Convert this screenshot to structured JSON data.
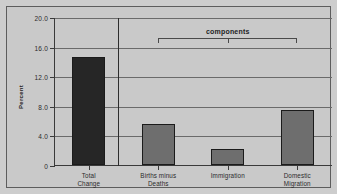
{
  "chart_data": {
    "type": "bar",
    "title": "",
    "xlabel": "",
    "ylabel": "Percent",
    "categories": [
      "Total Change",
      "Births minus Deaths",
      "Immigration",
      "Domestic Migration"
    ],
    "category_lines": [
      [
        "Total",
        "Change"
      ],
      [
        "Births minus",
        "Deaths"
      ],
      [
        "Immigration"
      ],
      [
        "Domestic",
        "Migration"
      ]
    ],
    "values": [
      14.6,
      5.6,
      2.1,
      7.4
    ],
    "bar_colors": [
      "#262626",
      "#6e6e6e",
      "#6e6e6e",
      "#6e6e6e"
    ],
    "ylim": [
      0,
      20
    ],
    "ytick_values": [
      0,
      4.0,
      8.0,
      12.0,
      16.0,
      20.0
    ],
    "ytick_labels": [
      "0",
      "4.0",
      "8.0",
      "12.0",
      "16.0",
      "20.0"
    ],
    "grid": true,
    "legend": "none",
    "annotations": [
      {
        "type": "bracket",
        "label": "components",
        "spans_categories": [
          "Births minus Deaths",
          "Immigration",
          "Domestic Migration"
        ]
      },
      {
        "type": "vertical-separator",
        "after_category": "Total Change"
      }
    ],
    "colors": {
      "plot_background": "#c9c9c9",
      "figure_background": "#cdcdcd",
      "gridline": "#6a6a6a",
      "axis": "#3a3a3a",
      "frame_border": "#5d5d5d",
      "text": "#2b2b2b"
    }
  }
}
